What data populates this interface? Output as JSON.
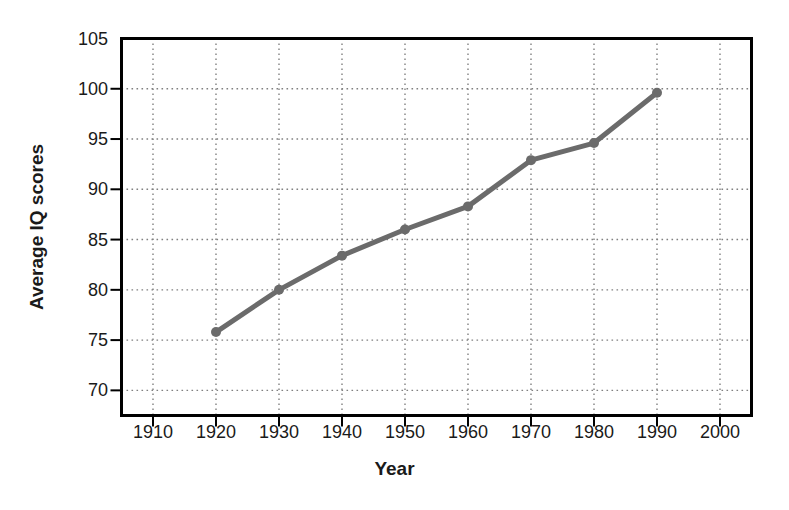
{
  "chart_data": {
    "type": "line",
    "title": "",
    "subtitle": "",
    "xlabel": "Year",
    "ylabel": "Average IQ scores",
    "x": [
      1920,
      1930,
      1940,
      1950,
      1960,
      1970,
      1980,
      1990
    ],
    "values": [
      75.8,
      80.0,
      83.4,
      86.0,
      88.3,
      92.9,
      94.6,
      99.6
    ],
    "series": [
      {
        "name": "Average IQ scores",
        "x": [
          1920,
          1930,
          1940,
          1950,
          1960,
          1970,
          1980,
          1990
        ],
        "values": [
          75.8,
          80.0,
          83.4,
          86.0,
          88.3,
          92.9,
          94.6,
          99.6
        ]
      }
    ],
    "xlim": [
      1905,
      2005
    ],
    "ylim": [
      67.5,
      105
    ],
    "xticks": [
      1910,
      1920,
      1930,
      1940,
      1950,
      1960,
      1970,
      1980,
      1990,
      2000
    ],
    "xtick_labels": [
      "1910",
      "1920",
      "1930",
      "1940",
      "1950",
      "1960",
      "1970",
      "1980",
      "1990",
      "2000"
    ],
    "yticks": [
      70,
      75,
      80,
      85,
      90,
      95,
      100,
      105
    ],
    "ytick_labels": [
      "70",
      "75",
      "80",
      "85",
      "90",
      "95",
      "100",
      "105"
    ],
    "grid": true,
    "grid_style": "dotted",
    "legend": false,
    "legend_position": "none",
    "line_color": "#6b6b6b",
    "marker": "circle",
    "marker_color": "#6b6b6b",
    "frame_color": "#000000",
    "background_color": "#ffffff",
    "grid_color": "#808080",
    "annotations": []
  }
}
